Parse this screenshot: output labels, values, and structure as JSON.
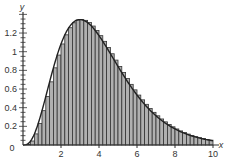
{
  "chart_data": {
    "type": "bar",
    "title": "",
    "xlabel": "x",
    "ylabel": "y",
    "xlim": [
      0,
      10
    ],
    "ylim": [
      0,
      1.4
    ],
    "grid": false,
    "legend": null,
    "x_ticks": [
      "2",
      "4",
      "6",
      "8",
      "10"
    ],
    "x_tick_values": [
      2,
      4,
      6,
      8,
      10
    ],
    "y_ticks": [
      "0",
      "0.2",
      "0.4",
      "0.6",
      "0.8",
      "1",
      "1.2"
    ],
    "y_tick_values": [
      0,
      0.2,
      0.4,
      0.6,
      0.8,
      1.0,
      1.2
    ],
    "origin_label": "0",
    "bar_width": 0.2,
    "bar_left_edges": [
      0,
      0.2,
      0.4,
      0.6,
      0.8,
      1.0,
      1.2,
      1.4,
      1.6,
      1.8,
      2.0,
      2.2,
      2.4,
      2.6,
      2.8,
      3.0,
      3.2,
      3.4,
      3.6,
      3.8,
      4.0,
      4.2,
      4.4,
      4.6,
      4.8,
      5.0,
      5.2,
      5.4,
      5.6,
      5.8,
      6.0,
      6.2,
      6.4,
      6.6,
      6.8,
      7.0,
      7.2,
      7.4,
      7.6,
      7.8,
      8.0,
      8.2,
      8.4,
      8.6,
      8.8,
      9.0,
      9.2,
      9.4,
      9.6,
      9.8
    ],
    "values": [
      0,
      0.007,
      0.043,
      0.119,
      0.23,
      0.368,
      0.52,
      0.677,
      0.827,
      0.964,
      1.083,
      1.181,
      1.257,
      1.31,
      1.34,
      1.344,
      1.336,
      1.312,
      1.275,
      1.228,
      1.172,
      1.111,
      1.046,
      0.978,
      0.91,
      0.842,
      0.776,
      0.712,
      0.65,
      0.591,
      0.535,
      0.484,
      0.436,
      0.391,
      0.35,
      0.313,
      0.279,
      0.248,
      0.22,
      0.195,
      0.172,
      0.151,
      0.133,
      0.117,
      0.103,
      0.09,
      0.079,
      0.069,
      0.06,
      0.052
    ],
    "curve": {
      "description": "smooth curve y = x^3 e^(-x)",
      "peak": [
        3,
        1.34
      ]
    },
    "colors": {
      "bar_fill": "#b0b0b0",
      "bar_stroke": "#333333",
      "curve": "#222222",
      "axis": "#333333"
    }
  }
}
